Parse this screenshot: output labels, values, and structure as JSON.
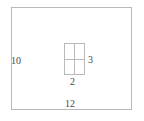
{
  "figure": {
    "type": "geometry-diagram",
    "stroke_color": "#b9b9b9",
    "text_color": "#4a4a4a",
    "background_color": "#ffffff"
  },
  "outer_rectangle": {
    "name": "outer-rectangle",
    "left_label": "10",
    "bottom_label": "12"
  },
  "inner_rectangle": {
    "name": "inner-rectangle",
    "right_label": "3",
    "bottom_label": "2",
    "divisions": 4
  },
  "chart_data": {
    "type": "table",
    "title": "",
    "categories": [
      "outer rectangle width",
      "outer rectangle height",
      "inner rectangle width",
      "inner rectangle height"
    ],
    "values": [
      12,
      10,
      2,
      3
    ],
    "xlabel": "",
    "ylabel": ""
  }
}
